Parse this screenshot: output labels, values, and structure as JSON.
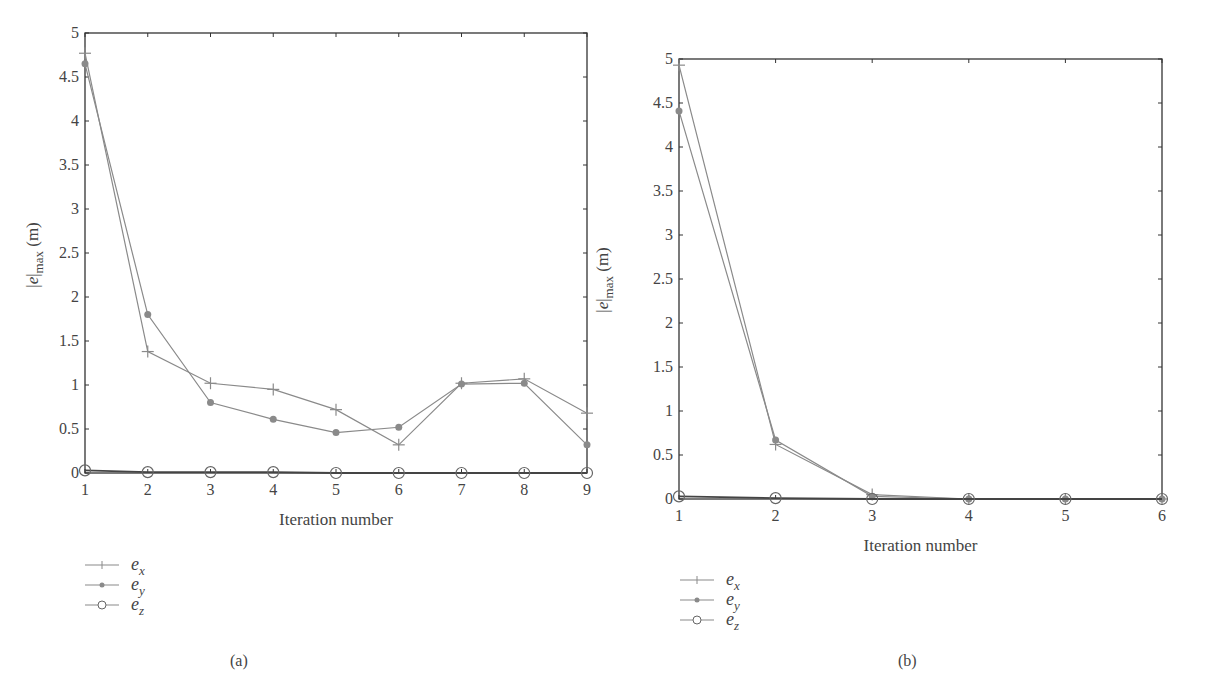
{
  "chart_data": [
    {
      "panel": "(a)",
      "type": "line",
      "title": "",
      "xlabel": "Iteration number",
      "ylabel": "|e|max (m)",
      "x": [
        1,
        2,
        3,
        4,
        5,
        6,
        7,
        8,
        9
      ],
      "xlim": [
        1,
        9
      ],
      "ylim": [
        0,
        5
      ],
      "yticks": [
        "0",
        "0.5",
        "1",
        "1.5",
        "2",
        "2.5",
        "3",
        "3.5",
        "4",
        "4.5",
        "5"
      ],
      "xticks": [
        "1",
        "2",
        "3",
        "4",
        "5",
        "6",
        "7",
        "8",
        "9"
      ],
      "grid": false,
      "legend_position": "below-left",
      "series": [
        {
          "name": "e_x",
          "marker": "plus",
          "values": [
            4.77,
            1.38,
            1.02,
            0.95,
            0.72,
            0.32,
            1.02,
            1.07,
            0.68
          ]
        },
        {
          "name": "e_y",
          "marker": "dot",
          "values": [
            4.65,
            1.8,
            0.8,
            0.61,
            0.46,
            0.52,
            1.01,
            1.02,
            0.32
          ]
        },
        {
          "name": "e_z",
          "marker": "circle",
          "values": [
            0.03,
            0.01,
            0.01,
            0.01,
            0.0,
            0.0,
            0.0,
            0.0,
            0.0
          ]
        }
      ]
    },
    {
      "panel": "(b)",
      "type": "line",
      "title": "",
      "xlabel": "Iteration number",
      "ylabel": "|e|max (m)",
      "x": [
        1,
        2,
        3,
        4,
        5,
        6
      ],
      "xlim": [
        1,
        6
      ],
      "ylim": [
        0,
        5
      ],
      "yticks": [
        "0",
        "0.5",
        "1",
        "1.5",
        "2",
        "2.5",
        "3",
        "3.5",
        "4",
        "4.5",
        "5"
      ],
      "xticks": [
        "1",
        "2",
        "3",
        "4",
        "5",
        "6"
      ],
      "grid": false,
      "legend_position": "below-left",
      "series": [
        {
          "name": "e_x",
          "marker": "plus",
          "values": [
            4.93,
            0.62,
            0.05,
            0.0,
            0.0,
            0.0
          ]
        },
        {
          "name": "e_y",
          "marker": "dot",
          "values": [
            4.41,
            0.67,
            0.03,
            0.0,
            0.0,
            0.0
          ]
        },
        {
          "name": "e_z",
          "marker": "circle",
          "values": [
            0.03,
            0.01,
            0.0,
            0.0,
            0.0,
            0.0
          ]
        }
      ]
    }
  ],
  "panels": {
    "a": {
      "caption": "(a)",
      "xlabel": "Iteration number",
      "ylabel_main": "|e|",
      "ylabel_sub": "max",
      "ylabel_unit": " (m)",
      "legend": [
        {
          "base": "e",
          "sub": "x"
        },
        {
          "base": "e",
          "sub": "y"
        },
        {
          "base": "e",
          "sub": "z"
        }
      ]
    },
    "b": {
      "caption": "(b)",
      "xlabel": "Iteration number",
      "ylabel_main": "|e|",
      "ylabel_sub": "max",
      "ylabel_unit": " (m)",
      "legend": [
        {
          "base": "e",
          "sub": "x"
        },
        {
          "base": "e",
          "sub": "y"
        },
        {
          "base": "e",
          "sub": "z"
        }
      ]
    }
  },
  "colors": {
    "axis": "#333333",
    "line": "#8a8a8a",
    "dot": "#8a8a8a",
    "text": "#444444"
  }
}
